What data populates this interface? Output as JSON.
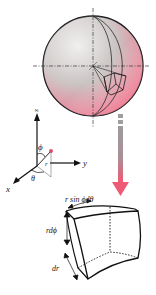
{
  "diagram": {
    "colors": {
      "sphere_light": "#e6e4e2",
      "sphere_pink": "#f2607a",
      "outline": "#1a1a1a",
      "arrow_gray": "#9a9a9a",
      "arrow_pink": "#ee5a74",
      "point_pink": "#e8506c"
    },
    "axes": {
      "z_label": "z",
      "y_label": "y",
      "x_label": "x",
      "phi_label": "ϕ",
      "theta_label": "θ",
      "r_label": "r"
    },
    "element_labels": {
      "width": "r sin ϕdθ",
      "height": "rdϕ",
      "depth": "dr"
    }
  }
}
